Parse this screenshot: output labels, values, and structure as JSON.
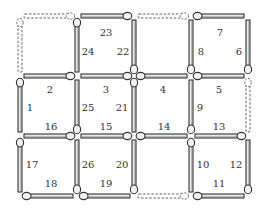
{
  "colors": {
    "ink": "#333333",
    "stick_fill": "#e8e8e8",
    "head_fill": "#f2f2f2",
    "dashed": "#555555",
    "background": "#ffffff"
  },
  "grid": {
    "columns_x": [
      20,
      77,
      134,
      191,
      248
    ],
    "rows_y": [
      16,
      76,
      136,
      196
    ]
  },
  "horizontal_matches": [
    {
      "row": 0,
      "col": 0,
      "number": "",
      "present": false,
      "head": "right"
    },
    {
      "row": 0,
      "col": 1,
      "number": "23",
      "present": true,
      "head": "right"
    },
    {
      "row": 0,
      "col": 2,
      "number": "",
      "present": false,
      "head": "right"
    },
    {
      "row": 0,
      "col": 3,
      "number": "7",
      "present": true,
      "head": "left"
    },
    {
      "row": 1,
      "col": 0,
      "number": "2",
      "present": true,
      "head": "right"
    },
    {
      "row": 1,
      "col": 1,
      "number": "3",
      "present": true,
      "head": "right"
    },
    {
      "row": 1,
      "col": 2,
      "number": "4",
      "present": true,
      "head": "left"
    },
    {
      "row": 1,
      "col": 3,
      "number": "5",
      "present": true,
      "head": "left"
    },
    {
      "row": 2,
      "col": 0,
      "number": "16",
      "present": true,
      "head": "right"
    },
    {
      "row": 2,
      "col": 1,
      "number": "15",
      "present": true,
      "head": "right"
    },
    {
      "row": 2,
      "col": 2,
      "number": "14",
      "present": true,
      "head": "left"
    },
    {
      "row": 2,
      "col": 3,
      "number": "13",
      "present": true,
      "head": "right"
    },
    {
      "row": 3,
      "col": 0,
      "number": "18",
      "present": true,
      "head": "left"
    },
    {
      "row": 3,
      "col": 1,
      "number": "19",
      "present": true,
      "head": "left"
    },
    {
      "row": 3,
      "col": 2,
      "number": "",
      "present": false,
      "head": "right"
    },
    {
      "row": 3,
      "col": 3,
      "number": "11",
      "present": true,
      "head": "left"
    }
  ],
  "vertical_matches": [
    {
      "row": 0,
      "col": 0,
      "number": "",
      "present": false,
      "head": "top"
    },
    {
      "row": 0,
      "col": 1,
      "number": "24",
      "present": true,
      "head": "top"
    },
    {
      "row": 0,
      "col": 2,
      "number": "22",
      "present": true,
      "head": "bottom"
    },
    {
      "row": 0,
      "col": 3,
      "number": "8",
      "present": true,
      "head": "bottom"
    },
    {
      "row": 0,
      "col": 4,
      "number": "6",
      "present": true,
      "head": "bottom"
    },
    {
      "row": 1,
      "col": 0,
      "number": "1",
      "present": true,
      "head": "top"
    },
    {
      "row": 1,
      "col": 1,
      "number": "25",
      "present": true,
      "head": "bottom"
    },
    {
      "row": 1,
      "col": 2,
      "number": "21",
      "present": true,
      "head": "top"
    },
    {
      "row": 1,
      "col": 3,
      "number": "9",
      "present": true,
      "head": "bottom"
    },
    {
      "row": 1,
      "col": 4,
      "number": "",
      "present": false,
      "head": "top"
    },
    {
      "row": 2,
      "col": 0,
      "number": "17",
      "present": true,
      "head": "top"
    },
    {
      "row": 2,
      "col": 1,
      "number": "26",
      "present": true,
      "head": "bottom"
    },
    {
      "row": 2,
      "col": 2,
      "number": "20",
      "present": true,
      "head": "bottom"
    },
    {
      "row": 2,
      "col": 3,
      "number": "10",
      "present": true,
      "head": "top"
    },
    {
      "row": 2,
      "col": 4,
      "number": "12",
      "present": true,
      "head": "bottom"
    }
  ],
  "labels": [
    {
      "text": "23",
      "x": 106,
      "y": 33
    },
    {
      "text": "24",
      "x": 88,
      "y": 52
    },
    {
      "text": "22",
      "x": 123,
      "y": 52
    },
    {
      "text": "7",
      "x": 220,
      "y": 33
    },
    {
      "text": "8",
      "x": 201,
      "y": 52
    },
    {
      "text": "6",
      "x": 239,
      "y": 52
    },
    {
      "text": "2",
      "x": 50,
      "y": 90
    },
    {
      "text": "3",
      "x": 106,
      "y": 90
    },
    {
      "text": "4",
      "x": 163,
      "y": 90
    },
    {
      "text": "5",
      "x": 219,
      "y": 90
    },
    {
      "text": "1",
      "x": 30,
      "y": 108
    },
    {
      "text": "25",
      "x": 88,
      "y": 108
    },
    {
      "text": "21",
      "x": 122,
      "y": 108
    },
    {
      "text": "9",
      "x": 200,
      "y": 108
    },
    {
      "text": "16",
      "x": 51,
      "y": 127
    },
    {
      "text": "15",
      "x": 106,
      "y": 127
    },
    {
      "text": "14",
      "x": 164,
      "y": 127
    },
    {
      "text": "13",
      "x": 219,
      "y": 127
    },
    {
      "text": "17",
      "x": 32,
      "y": 165
    },
    {
      "text": "26",
      "x": 88,
      "y": 165
    },
    {
      "text": "20",
      "x": 122,
      "y": 165
    },
    {
      "text": "10",
      "x": 203,
      "y": 165
    },
    {
      "text": "12",
      "x": 236,
      "y": 165
    },
    {
      "text": "18",
      "x": 51,
      "y": 184
    },
    {
      "text": "19",
      "x": 106,
      "y": 184
    },
    {
      "text": "11",
      "x": 219,
      "y": 184
    }
  ]
}
